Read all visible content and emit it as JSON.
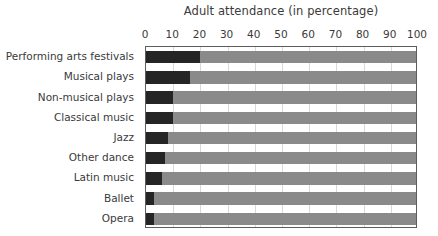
{
  "chart_data": {
    "type": "bar",
    "orientation": "horizontal",
    "title": "Adult attendance (in percentage)",
    "xlabel": "",
    "ylabel": "",
    "categories": [
      "Performing arts festivals",
      "Musical plays",
      "Non-musical plays",
      "Classical music",
      "Jazz",
      "Other dance",
      "Latin music",
      "Ballet",
      "Opera"
    ],
    "values": [
      20,
      16,
      10,
      10,
      8,
      7,
      6,
      3,
      3
    ],
    "xlim": [
      0,
      100
    ],
    "xticks": [
      0,
      10,
      20,
      30,
      40,
      50,
      60,
      70,
      80,
      90,
      100
    ],
    "xtick_labels": [
      "0",
      "10",
      "20",
      "30",
      "40",
      "50",
      "60",
      "70",
      "80",
      "90",
      "100"
    ],
    "grid": true,
    "legend": false,
    "colors": {
      "bar_value": "#252525",
      "bar_track": "#8a8a8a",
      "gridline": "#d8d8d8",
      "frame": "#5c5c5c",
      "background": "#ffffff",
      "text": "#3a3a3a"
    }
  }
}
